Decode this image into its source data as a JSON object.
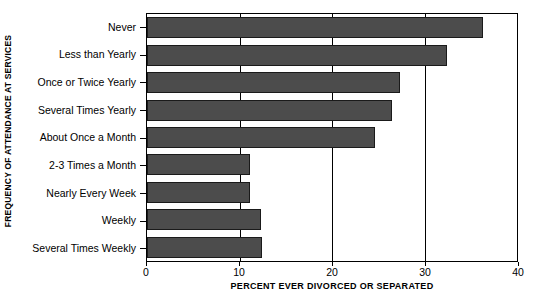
{
  "chart_data": {
    "type": "bar",
    "orientation": "horizontal",
    "title": "",
    "xlabel": "PERCENT EVER DIVORCED OR SEPARATED",
    "ylabel": "FREQUENCY OF ATTENDANCE AT SERVICES",
    "categories": [
      "Never",
      "Less than Yearly",
      "Once or Twice Yearly",
      "Several Times Yearly",
      "About Once a Month",
      "2-3 Times a Month",
      "Nearly Every Week",
      "Weekly",
      "Several Times Weekly"
    ],
    "values": [
      36.3,
      32.4,
      27.4,
      26.5,
      24.7,
      11.1,
      11.1,
      12.3,
      12.4
    ],
    "xlim": [
      0,
      40
    ],
    "xticks": [
      0,
      10,
      20,
      30,
      40
    ],
    "xtick_labels": [
      "0",
      "10",
      "20",
      "30",
      "40"
    ],
    "grid": true,
    "gridlines_at": [
      10,
      20,
      30
    ],
    "legend": "none",
    "bar_color": "#4c4c4c",
    "bar_edge_color": "#1a1a1a",
    "axis_color": "#000000",
    "background_color": "#ffffff"
  }
}
